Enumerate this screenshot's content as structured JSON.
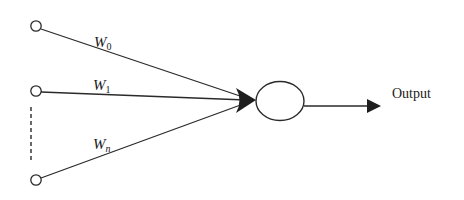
{
  "diagram": {
    "type": "perceptron",
    "colors": {
      "line": "#2a2a2a",
      "text": "#1a1a1a",
      "background": "#ffffff"
    },
    "inputs": [
      {
        "id": "input-0",
        "weight_symbol": "W",
        "weight_subscript": "0"
      },
      {
        "id": "input-1",
        "weight_symbol": "W",
        "weight_subscript": "1"
      },
      {
        "id": "input-n",
        "weight_symbol": "W",
        "weight_subscript": "n"
      }
    ],
    "neuron": {
      "label": ""
    },
    "output": {
      "label": "Output"
    }
  }
}
